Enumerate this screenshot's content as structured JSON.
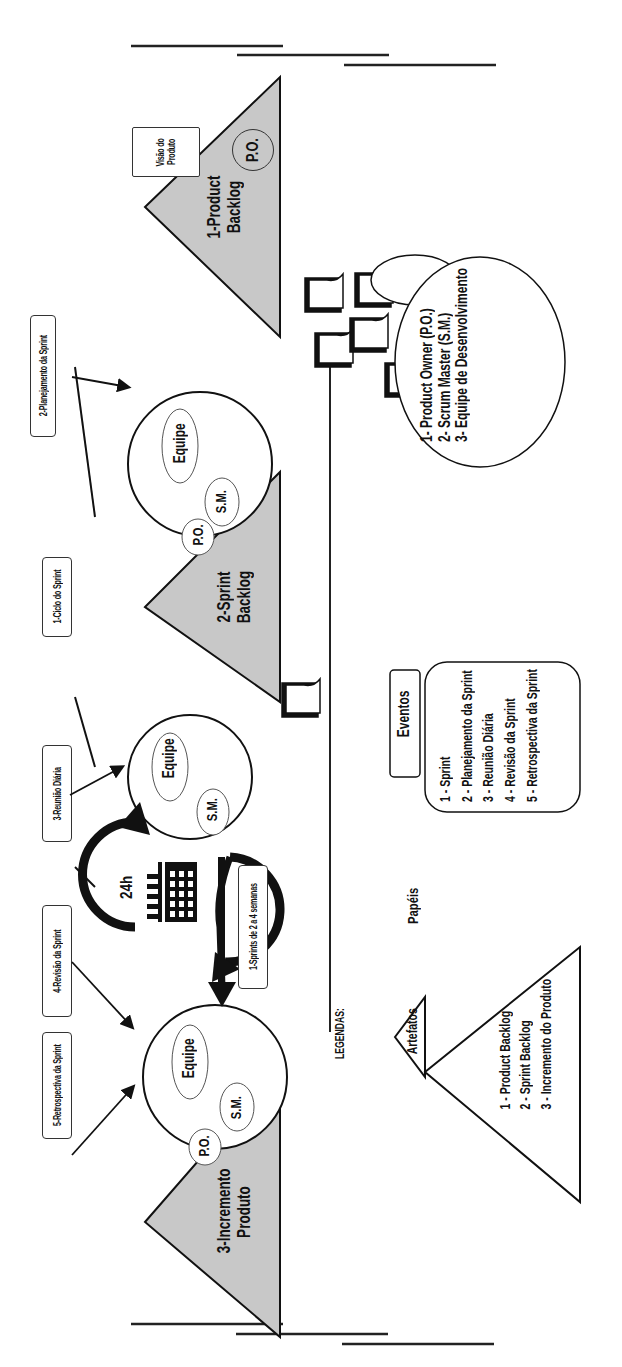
{
  "diagram": {
    "orientation": "rotated-90-ccw",
    "colors": {
      "stroke": "#111111",
      "triangle_fill": "#c8c8c8",
      "background": "#ffffff"
    }
  },
  "flow": {
    "product_vision": {
      "label": "Visão do Produto",
      "line1": "Visão do",
      "line2": "Produto"
    },
    "po_badge": "P.O.",
    "product_backlog": {
      "line1": "1-Product",
      "line2": "Backlog"
    },
    "sprint_planning_label": "2-Planejamento da Sprint",
    "planning_team": {
      "team": "Equipe",
      "po": "P.O.",
      "sm": "S.M."
    },
    "sprint_cycle_label": "1-Ciclo do Sprint",
    "sprint_backlog": {
      "line1": "2-Sprint",
      "line2": "Backlog"
    },
    "daily_label": "3-Reunião Diária",
    "daily_team": {
      "team": "Equipe",
      "sm": "S.M."
    },
    "cycle_hours": "24h",
    "sprint_length_label": "1-Sprints de 2 a 4 semanas",
    "review_label": "4-Revisão da Sprint",
    "retro_label": "5-Retrospectiva da Sprint",
    "review_team": {
      "team": "Equipe",
      "po": "P.O.",
      "sm": "S.M."
    },
    "increment": {
      "line1": "3-Incremento",
      "line2": "Produto"
    }
  },
  "legend": {
    "heading": "LEGENDAS:",
    "roles": {
      "title": "Papéis",
      "items": [
        "1- Product Owner (P.O.)",
        "2- Scrum Master (S.M.)",
        "3- Equipe de Desenvolvimento"
      ]
    },
    "events": {
      "title": "Eventos",
      "items": [
        "1 - Sprint",
        "2 - Planejamento da Sprint",
        "3 - Reunião Diária",
        "4 - Revisão da Sprint",
        "5 - Retrospectiva da Sprint"
      ]
    },
    "artifacts": {
      "title": "Artefatos",
      "items": [
        "1 - Product Backlog",
        "2 - Sprint Backlog",
        "3 - Incremento do Produto"
      ]
    }
  }
}
